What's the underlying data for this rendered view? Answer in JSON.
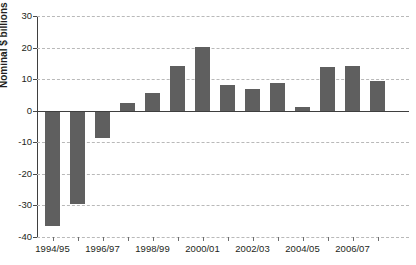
{
  "chart_data": {
    "type": "bar",
    "title": "",
    "subtitle": "",
    "xlabel": "",
    "ylabel": "Nominal $ billions",
    "ylim": [
      -40,
      30
    ],
    "yticks": [
      30,
      20,
      10,
      0,
      -10,
      -20,
      -30,
      -40
    ],
    "ytick_labels": [
      "30",
      "20",
      "10",
      "0",
      "-10",
      "-20",
      "-30",
      "-40"
    ],
    "grid": true,
    "grid_axis": "y",
    "legend": null,
    "bar_color": "#5f5f5f",
    "categories": [
      "1994/95",
      "1995/96",
      "1996/97",
      "1997/98",
      "1998/99",
      "1999/00",
      "2000/01",
      "2001/02",
      "2002/03",
      "2003/04",
      "2004/05",
      "2005/06",
      "2006/07",
      "2007/08"
    ],
    "visible_xtick_labels": [
      "1994/95",
      "1996/97",
      "1998/99",
      "2000/01",
      "2002/03",
      "2004/05",
      "2006/07"
    ],
    "values": [
      -36.5,
      -29.5,
      -8.5,
      2.5,
      5.5,
      14.2,
      20.2,
      8.0,
      6.8,
      8.8,
      1.2,
      13.7,
      14.2,
      9.3
    ]
  }
}
